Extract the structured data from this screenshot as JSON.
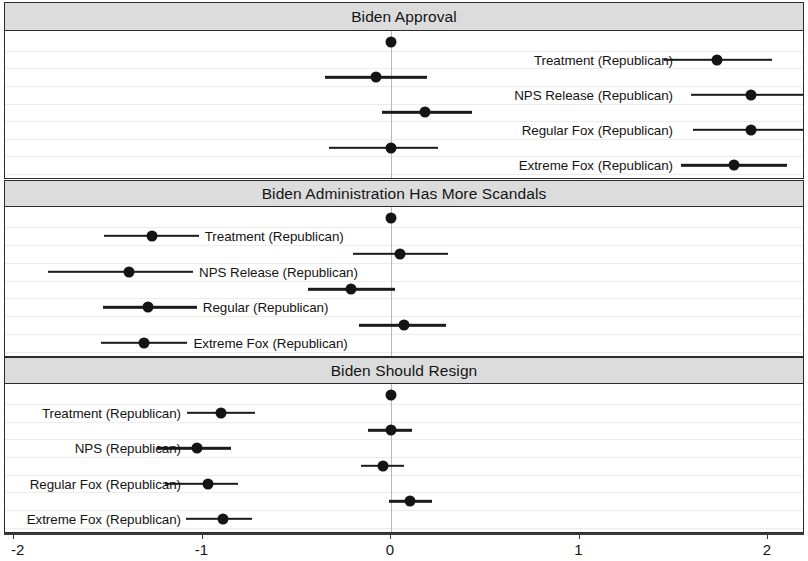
{
  "chart_data": {
    "type": "scatter",
    "plot_kind": "coefficient-plot-with-confidence-intervals",
    "title": "",
    "xlabel": "",
    "ylabel": "",
    "xlim": [
      -2,
      2
    ],
    "xticks": [
      -2,
      -1,
      0,
      1,
      2
    ],
    "xticklabels": [
      "-2",
      "-1",
      "0",
      "1",
      "2"
    ],
    "grid": "faint horizontal gridlines only",
    "legend": "none",
    "zero_reference_line": 0,
    "colors": {
      "point": "#141414",
      "interval": "#1b1b1b",
      "panel_strip": "#dcdcdc",
      "panel_border": "#2b2b2b",
      "gridline": "#ececec",
      "zeroline": "#b9b9b9",
      "background": "#ffffff"
    },
    "panels": [
      {
        "title": "Biden Approval",
        "label_side": "right",
        "points": [
          {
            "label": "",
            "estimate": 0.0,
            "ci_low": 0.0,
            "ci_high": 0.0,
            "labelled": false
          },
          {
            "label": "Treatment (Republican)",
            "estimate": 1.73,
            "ci_low": 1.45,
            "ci_high": 2.02,
            "labelled": true
          },
          {
            "label": "",
            "estimate": -0.08,
            "ci_low": -0.35,
            "ci_high": 0.19,
            "labelled": false
          },
          {
            "label": "NPS Release (Republican)",
            "estimate": 1.91,
            "ci_low": 1.59,
            "ci_high": 2.24,
            "labelled": true
          },
          {
            "label": "",
            "estimate": 0.18,
            "ci_low": -0.05,
            "ci_high": 0.43,
            "labelled": false
          },
          {
            "label": "Regular Fox (Republican)",
            "estimate": 1.91,
            "ci_low": 1.6,
            "ci_high": 2.22,
            "labelled": true
          },
          {
            "label": "",
            "estimate": 0.0,
            "ci_low": -0.33,
            "ci_high": 0.25,
            "labelled": false
          },
          {
            "label": "Extreme Fox (Republican)",
            "estimate": 1.82,
            "ci_low": 1.54,
            "ci_high": 2.1,
            "labelled": true
          }
        ]
      },
      {
        "title": "Biden Administration Has More Scandals",
        "label_side": "inline-right-of-point",
        "points": [
          {
            "label": "",
            "estimate": 0.0,
            "ci_low": 0.0,
            "ci_high": 0.0,
            "labelled": false
          },
          {
            "label": "Treatment (Republican)",
            "estimate": -1.27,
            "ci_low": -1.52,
            "ci_high": -1.02,
            "labelled": true
          },
          {
            "label": "",
            "estimate": 0.05,
            "ci_low": -0.2,
            "ci_high": 0.3,
            "labelled": false
          },
          {
            "label": "NPS Release (Republican)",
            "estimate": -1.39,
            "ci_low": -1.82,
            "ci_high": -1.05,
            "labelled": true
          },
          {
            "label": "",
            "estimate": -0.21,
            "ci_low": -0.44,
            "ci_high": 0.02,
            "labelled": false
          },
          {
            "label": "Regular (Republican)",
            "estimate": -1.29,
            "ci_low": -1.53,
            "ci_high": -1.03,
            "labelled": true
          },
          {
            "label": "",
            "estimate": 0.07,
            "ci_low": -0.17,
            "ci_high": 0.29,
            "labelled": false
          },
          {
            "label": "Extreme Fox (Republican)",
            "estimate": -1.31,
            "ci_low": -1.54,
            "ci_high": -1.08,
            "labelled": true
          }
        ]
      },
      {
        "title": "Biden Should Resign",
        "label_side": "left",
        "points": [
          {
            "label": "",
            "estimate": 0.0,
            "ci_low": 0.0,
            "ci_high": 0.0,
            "labelled": false
          },
          {
            "label": "Treatment (Republican)",
            "estimate": -0.9,
            "ci_low": -1.08,
            "ci_high": -0.72,
            "labelled": true
          },
          {
            "label": "",
            "estimate": 0.0,
            "ci_low": -0.12,
            "ci_high": 0.11,
            "labelled": false
          },
          {
            "label": "NPS (Republican)",
            "estimate": -1.03,
            "ci_low": -1.24,
            "ci_high": -0.85,
            "labelled": true
          },
          {
            "label": "",
            "estimate": -0.04,
            "ci_low": -0.16,
            "ci_high": 0.07,
            "labelled": false
          },
          {
            "label": "Regular Fox (Republican)",
            "estimate": -0.97,
            "ci_low": -1.2,
            "ci_high": -0.81,
            "labelled": true
          },
          {
            "label": "",
            "estimate": 0.1,
            "ci_low": -0.01,
            "ci_high": 0.22,
            "labelled": false
          },
          {
            "label": "Extreme Fox (Republican)",
            "estimate": -0.89,
            "ci_low": -1.09,
            "ci_high": -0.74,
            "labelled": true
          }
        ]
      }
    ]
  }
}
